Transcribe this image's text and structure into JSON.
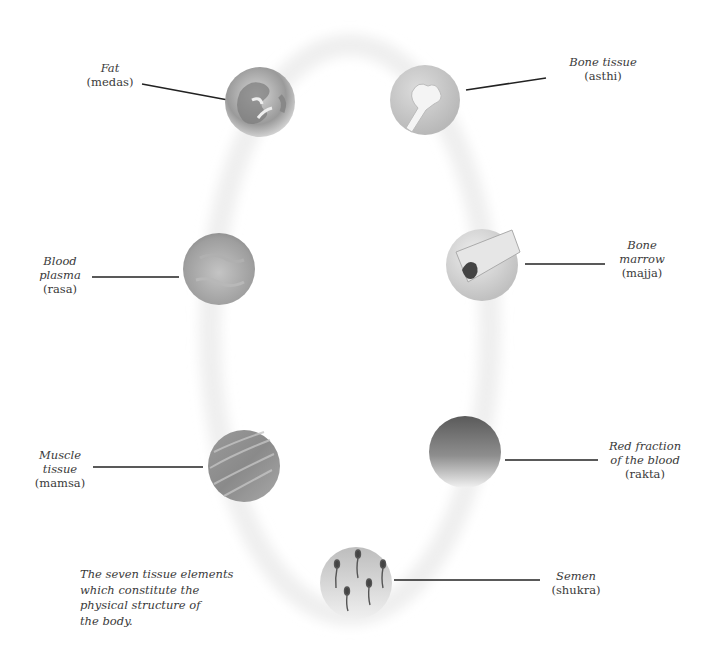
{
  "diagram": {
    "caption": "The seven tissue elements which constitute the physical structure of the body.",
    "caption_lines": [
      "The seven tissue elements",
      "which constitute the",
      "physical structure of",
      "the body."
    ],
    "tissues": [
      {
        "id": "fat",
        "english": "Fat",
        "sanskrit": "(medas)",
        "english_lines": [
          "Fat"
        ]
      },
      {
        "id": "bone",
        "english": "Bone tissue",
        "sanskrit": "(asthi)",
        "english_lines": [
          "Bone tissue"
        ]
      },
      {
        "id": "plasma",
        "english": "Blood plasma",
        "sanskrit": "(rasa)",
        "english_lines": [
          "Blood",
          "plasma"
        ]
      },
      {
        "id": "marrow",
        "english": "Bone marrow",
        "sanskrit": "(majja)",
        "english_lines": [
          "Bone",
          "marrow"
        ]
      },
      {
        "id": "muscle",
        "english": "Muscle tissue",
        "sanskrit": "(mamsa)",
        "english_lines": [
          "Muscle",
          "tissue"
        ]
      },
      {
        "id": "rakta",
        "english": "Red fraction of the blood",
        "sanskrit": "(rakta)",
        "english_lines": [
          "Red fraction",
          "of the blood"
        ]
      },
      {
        "id": "semen",
        "english": "Semen",
        "sanskrit": "(shukra)",
        "english_lines": [
          "Semen"
        ]
      }
    ],
    "colors": {
      "line": "#222222",
      "text": "#3a3a3a",
      "ring": "#f1f1f1"
    }
  }
}
